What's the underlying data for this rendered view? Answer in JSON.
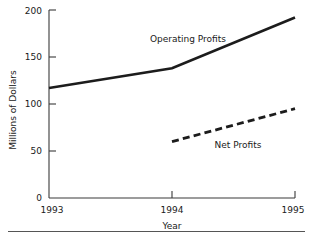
{
  "chart_data": {
    "type": "line",
    "title": "",
    "xlabel": "Year",
    "ylabel": "Millions of Dollars",
    "categories": [
      "1993",
      "1994",
      "1995"
    ],
    "x": [
      1993,
      1994,
      1995
    ],
    "xlim": [
      1993,
      1995
    ],
    "ylim": [
      0,
      200
    ],
    "y_ticks": [
      0,
      50,
      100,
      150,
      200
    ],
    "y_tick_labels": [
      "0",
      "50",
      "100",
      "150",
      "200"
    ],
    "x_tick_labels": [
      "1993",
      "1994",
      "1995"
    ],
    "grid": false,
    "legend_position": "inline-annotation",
    "series": [
      {
        "name": "Operating Profits",
        "style": "solid",
        "color": "#1c1c1c",
        "x": [
          1993,
          1994,
          1995
        ],
        "values": [
          117,
          138,
          192
        ]
      },
      {
        "name": "Net Profits",
        "style": "dashed",
        "color": "#1c1c1c",
        "x": [
          1994,
          1995
        ],
        "values": [
          60,
          95
        ]
      }
    ],
    "annotations": [
      {
        "text": "Operating Profits",
        "series": "Operating Profits"
      },
      {
        "text": "Net Profits",
        "series": "Net Profits"
      }
    ]
  },
  "axes": {
    "y_label": "Millions of Dollars",
    "x_label": "Year",
    "y_tick_0": "0",
    "y_tick_50": "50",
    "y_tick_100": "100",
    "y_tick_150": "150",
    "y_tick_200": "200",
    "x_tick_1993": "1993",
    "x_tick_1994": "1994",
    "x_tick_1995": "1995"
  },
  "labels": {
    "operating_profits": "Operating Profits",
    "net_profits": "Net Profits"
  }
}
